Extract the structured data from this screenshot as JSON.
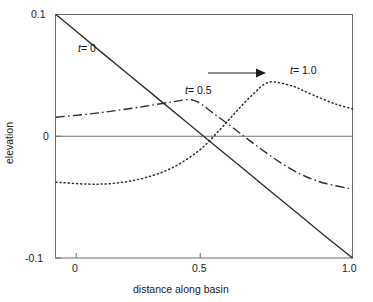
{
  "figure": {
    "name": "basin-elevation-profile-chart"
  },
  "chart_data": {
    "type": "line",
    "title": "",
    "subtitle": "",
    "xlabel": "distance along basin",
    "ylabel": "elevation",
    "xlim": [
      -0.065,
      1.0
    ],
    "ylim": [
      -0.1,
      0.1
    ],
    "grid": false,
    "legend_position": "inline-labels",
    "xticks": [
      0,
      0.5,
      1.0
    ],
    "xticklabels": [
      "0",
      "0.5",
      "1.0"
    ],
    "yticks": [
      0.1,
      0,
      -0.1
    ],
    "yticklabels": [
      "0.1",
      "0",
      "-0.1"
    ],
    "zero_line": true,
    "annotations": [
      {
        "name": "migration-arrow",
        "type": "arrow",
        "x_start": 0.52,
        "x_end": 0.71,
        "y": 0.05,
        "direction": "right"
      }
    ],
    "series": [
      {
        "name": "t = 0",
        "label": "t = 0",
        "label_t": "t",
        "label_value": "= 0",
        "linestyle": "solid",
        "color": "#2b2b2b",
        "x": [
          -0.065,
          0.0,
          0.1,
          0.2,
          0.3,
          0.4,
          0.5,
          0.6,
          0.7,
          0.8,
          0.9,
          1.0
        ],
        "y": [
          0.1,
          0.0876,
          0.0687,
          0.0499,
          0.0311,
          0.0123,
          -0.0065,
          -0.0253,
          -0.0441,
          -0.0629,
          -0.0817,
          -0.1
        ]
      },
      {
        "name": "t = 0.5",
        "label": "t = 0.5",
        "label_t": "t",
        "label_value": "= 0.5",
        "linestyle": "dashdot",
        "color": "#2b2b2b",
        "x": [
          -0.065,
          0.05,
          0.15,
          0.25,
          0.35,
          0.43,
          0.5,
          0.58,
          0.66,
          0.74,
          0.82,
          0.9,
          1.0
        ],
        "y": [
          0.0156,
          0.0182,
          0.0211,
          0.0244,
          0.0281,
          0.0295,
          0.0189,
          0.0053,
          -0.0086,
          -0.0215,
          -0.0318,
          -0.0386,
          -0.0434
        ]
      },
      {
        "name": "t = 1.0",
        "label": "t = 1.0",
        "label_t": "t",
        "label_value": "= 1.0",
        "linestyle": "dotted",
        "color": "#2b2b2b",
        "x": [
          -0.065,
          0.05,
          0.15,
          0.25,
          0.35,
          0.45,
          0.52,
          0.58,
          0.64,
          0.7,
          0.78,
          0.82,
          0.88,
          0.94,
          1.0
        ],
        "y": [
          -0.0377,
          -0.0393,
          -0.0385,
          -0.0344,
          -0.0262,
          -0.0115,
          0.0045,
          0.0197,
          0.0339,
          0.0444,
          0.0415,
          0.0378,
          0.0318,
          0.0264,
          0.0225
        ]
      }
    ]
  },
  "axes": {
    "x_axis_title": "distance along basin",
    "y_axis_title": "elevation",
    "x_tick_labels": [
      "0",
      "0.5",
      "1.0"
    ],
    "y_tick_labels": [
      "0.1",
      "0",
      "-0.1"
    ]
  },
  "colors": {
    "frame": "#6b6b6b",
    "curve": "#2b2b2b",
    "text": "#111111",
    "background": "#ffffff"
  }
}
